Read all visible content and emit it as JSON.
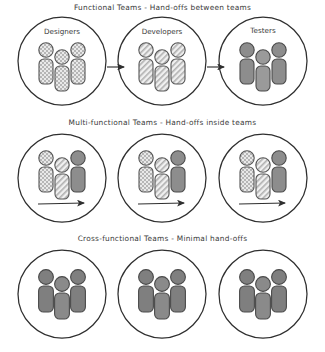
{
  "diagram": {
    "background_color": "#ffffff",
    "ink_color": "#2b2b2b",
    "rows": [
      {
        "id": "functional",
        "title": "Functional Teams - Hand-offs between teams",
        "arrows_between_circles": true,
        "arrows_inside_circles": false,
        "circles": [
          {
            "label": "Designers",
            "figures": [
              {
                "pattern": "checkered"
              },
              {
                "pattern": "checkered"
              },
              {
                "pattern": "checkered"
              }
            ]
          },
          {
            "label": "Developers",
            "figures": [
              {
                "pattern": "diagonal"
              },
              {
                "pattern": "diagonal"
              },
              {
                "pattern": "diagonal"
              }
            ]
          },
          {
            "label": "Testers",
            "figures": [
              {
                "pattern": "solid"
              },
              {
                "pattern": "solid"
              },
              {
                "pattern": "solid"
              }
            ]
          }
        ]
      },
      {
        "id": "multi-functional",
        "title": "Multi-functional Teams - Hand-offs inside teams",
        "arrows_between_circles": false,
        "arrows_inside_circles": true,
        "circles": [
          {
            "label": "",
            "figures": [
              {
                "pattern": "checkered"
              },
              {
                "pattern": "diagonal"
              },
              {
                "pattern": "solid"
              }
            ]
          },
          {
            "label": "",
            "figures": [
              {
                "pattern": "checkered"
              },
              {
                "pattern": "diagonal"
              },
              {
                "pattern": "solid"
              }
            ]
          },
          {
            "label": "",
            "figures": [
              {
                "pattern": "checkered"
              },
              {
                "pattern": "diagonal"
              },
              {
                "pattern": "solid"
              }
            ]
          }
        ]
      },
      {
        "id": "cross-functional",
        "title": "Cross-functional Teams - Minimal hand-offs",
        "arrows_between_circles": false,
        "arrows_inside_circles": false,
        "circles": [
          {
            "label": "",
            "figures": [
              {
                "pattern": "solid"
              },
              {
                "pattern": "solid"
              },
              {
                "pattern": "solid"
              }
            ]
          },
          {
            "label": "",
            "figures": [
              {
                "pattern": "solid"
              },
              {
                "pattern": "solid"
              },
              {
                "pattern": "solid"
              }
            ]
          },
          {
            "label": "",
            "figures": [
              {
                "pattern": "solid"
              },
              {
                "pattern": "solid"
              },
              {
                "pattern": "solid"
              }
            ]
          }
        ]
      }
    ],
    "palette": {
      "solid_fill": "#8d8d8d",
      "solid_stroke": "#4a4a4a",
      "checkered_fill": "#d8d8d8",
      "diagonal_fill": "#e4e4e4",
      "figure_stroke": "#555555",
      "circle_stroke": "#2f2f2f",
      "arrow_color": "#2f2f2f"
    },
    "geometry": {
      "circle_centers_x": [
        62,
        162,
        263
      ],
      "circle_radius": 44,
      "figure_offsets_x": [
        -20,
        0,
        20
      ]
    }
  }
}
